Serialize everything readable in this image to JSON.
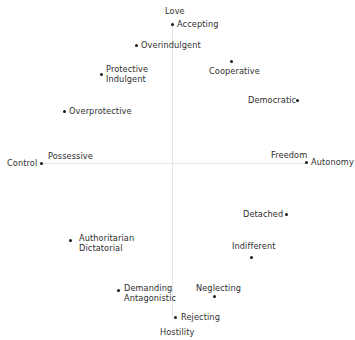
{
  "diagram": {
    "type": "two-axis parenting style map",
    "axes": {
      "vertical": {
        "top": "Love",
        "bottom": "Hostility"
      },
      "horizontal": {
        "left": "Control",
        "right": "Autonomy"
      }
    },
    "axis_labels": {
      "love": "Love",
      "hostility": "Hostility",
      "control": "Control",
      "possessive": "Possessive",
      "freedom": "Freedom",
      "autonomy": "Autonomy"
    },
    "points": {
      "accepting": "Accepting",
      "overindulgent": "Overindulgent",
      "cooperative": "Cooperative",
      "protective_line1": "Protective",
      "protective_line2": "Indulgent",
      "democratic": "Democratic",
      "overprotective": "Overprotective",
      "detached": "Detached",
      "indifferent": "Indifferent",
      "authoritarian_line1": "Authoritarian",
      "authoritarian_line2": "Dictatorial",
      "demanding_line1": "Demanding",
      "demanding_line2": "Antagonistic",
      "neglecting": "Neglecting",
      "rejecting": "Rejecting"
    },
    "colors": {
      "text": "#2e2e2e",
      "dot": "#1a1a1a",
      "axis": "#e6e6e6",
      "background": "#ffffff"
    }
  }
}
